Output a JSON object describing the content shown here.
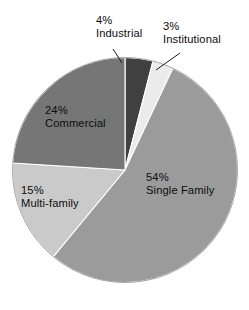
{
  "chart_data": {
    "type": "pie",
    "title": "",
    "subtitle": "",
    "xlabel": "",
    "ylabel": "",
    "grid": false,
    "legend_position": "none",
    "units": "percent",
    "total": 100,
    "start_angle_deg": 0,
    "direction": "clockwise",
    "categories": [
      "Industrial",
      "Institutional",
      "Single Family",
      "Multi-family",
      "Commercial"
    ],
    "values": [
      4,
      3,
      54,
      15,
      24
    ],
    "slices": [
      {
        "name": "Industrial",
        "value": 4,
        "percent_label": "4%",
        "color": "#404040",
        "label_placement": "outside",
        "has_leader_line": true
      },
      {
        "name": "Institutional",
        "value": 3,
        "percent_label": "3%",
        "color": "#ebebeb",
        "label_placement": "outside",
        "has_leader_line": true
      },
      {
        "name": "Single Family",
        "value": 54,
        "percent_label": "54%",
        "color": "#9b9b9b",
        "label_placement": "inside",
        "has_leader_line": false
      },
      {
        "name": "Multi-family",
        "value": 15,
        "percent_label": "15%",
        "color": "#cacaca",
        "label_placement": "inside",
        "has_leader_line": false
      },
      {
        "name": "Commercial",
        "value": 24,
        "percent_label": "24%",
        "color": "#767676",
        "label_placement": "inside",
        "has_leader_line": false
      }
    ]
  },
  "labels": {
    "industrial": {
      "pct": "4%",
      "name": "Industrial"
    },
    "institutional": {
      "pct": "3%",
      "name": "Institutional"
    },
    "single_family": {
      "pct": "54%",
      "name": "Single Family"
    },
    "multi_family": {
      "pct": "15%",
      "name": "Multi-family"
    },
    "commercial": {
      "pct": "24%",
      "name": "Commercial"
    }
  },
  "colors": {
    "background": "#ffffff",
    "text": "#0d0d0d",
    "slice_border": "#ffffff",
    "leader_line": "#1a1a1a"
  }
}
